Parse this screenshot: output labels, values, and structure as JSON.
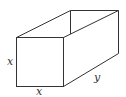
{
  "diagram": {
    "type": "rectangular-box",
    "labels": {
      "front_height": "x",
      "front_width": "x",
      "depth": "y"
    },
    "colors": {
      "stroke": "#333333",
      "background": "#ffffff"
    }
  }
}
